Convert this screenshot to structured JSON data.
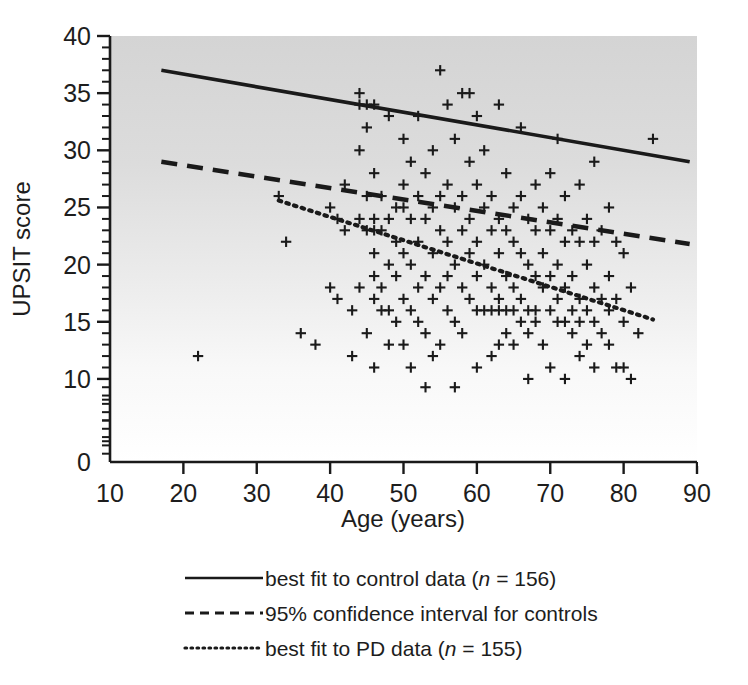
{
  "chart_data": {
    "type": "scatter",
    "title": "",
    "xlabel": "Age (years)",
    "ylabel": "UPSIT score",
    "xlim": [
      10,
      90
    ],
    "ylim": [
      0,
      40
    ],
    "xticks": [
      10,
      20,
      30,
      40,
      50,
      60,
      70,
      80,
      90
    ],
    "xtick_labels": [
      "10",
      "20",
      "30",
      "40",
      "50",
      "60",
      "70",
      "80",
      "90"
    ],
    "yticks": [
      0,
      10,
      15,
      20,
      25,
      30,
      35,
      40
    ],
    "ytick_labels": [
      "0",
      "10",
      "15",
      "20",
      "25",
      "30",
      "35",
      "40"
    ],
    "y_minor_step": 1,
    "x_minor_step": 10,
    "grid": false,
    "marker": "plus",
    "marker_color": "#1a1a1a",
    "plot_background": "vertical gradient light-grey (#d6d6d6) at top to white (#ffffff) at bottom",
    "background_top_color": "#d6d6d6",
    "background_bottom_color": "#ffffff",
    "legend_position": "below axes, centered",
    "series": [
      {
        "name": "best fit to control data",
        "type": "line",
        "style": "solid",
        "n": 156,
        "x": [
          17,
          89
        ],
        "y": [
          37.0,
          29.0
        ]
      },
      {
        "name": "95% confidence interval for controls",
        "type": "line",
        "style": "dashed",
        "x": [
          17,
          89
        ],
        "y": [
          29.0,
          21.8
        ]
      },
      {
        "name": "best fit to PD data",
        "type": "line",
        "style": "dotted",
        "n": 155,
        "x": [
          33,
          84
        ],
        "y": [
          25.6,
          15.2
        ]
      },
      {
        "name": "data points",
        "type": "scatter",
        "points": [
          [
            22,
            12
          ],
          [
            33,
            26
          ],
          [
            34,
            22
          ],
          [
            36,
            14
          ],
          [
            38,
            13
          ],
          [
            40,
            25
          ],
          [
            40,
            18
          ],
          [
            41,
            24
          ],
          [
            41,
            17
          ],
          [
            42,
            27
          ],
          [
            42,
            23
          ],
          [
            43,
            16
          ],
          [
            43,
            12
          ],
          [
            44,
            35
          ],
          [
            44,
            34
          ],
          [
            44,
            30
          ],
          [
            44,
            24
          ],
          [
            44,
            18
          ],
          [
            45,
            34
          ],
          [
            45,
            32
          ],
          [
            45,
            26
          ],
          [
            45,
            23
          ],
          [
            45,
            14
          ],
          [
            46,
            34
          ],
          [
            46,
            28
          ],
          [
            46,
            24
          ],
          [
            46,
            23
          ],
          [
            46,
            21
          ],
          [
            46,
            19
          ],
          [
            46,
            17
          ],
          [
            46,
            11
          ],
          [
            47,
            26
          ],
          [
            47,
            23
          ],
          [
            47,
            18
          ],
          [
            47,
            16
          ],
          [
            48,
            33
          ],
          [
            48,
            24
          ],
          [
            48,
            20
          ],
          [
            48,
            16
          ],
          [
            48,
            13
          ],
          [
            49,
            25
          ],
          [
            49,
            22
          ],
          [
            49,
            19
          ],
          [
            49,
            15
          ],
          [
            50,
            31
          ],
          [
            50,
            27
          ],
          [
            50,
            25
          ],
          [
            50,
            21
          ],
          [
            50,
            17
          ],
          [
            50,
            13
          ],
          [
            51,
            29
          ],
          [
            51,
            24
          ],
          [
            51,
            20
          ],
          [
            51,
            16
          ],
          [
            51,
            11
          ],
          [
            52,
            33
          ],
          [
            52,
            26
          ],
          [
            52,
            22
          ],
          [
            52,
            18
          ],
          [
            52,
            15
          ],
          [
            53,
            28
          ],
          [
            53,
            24
          ],
          [
            53,
            19
          ],
          [
            53,
            14
          ],
          [
            53,
            9
          ],
          [
            54,
            30
          ],
          [
            54,
            25
          ],
          [
            54,
            21
          ],
          [
            54,
            17
          ],
          [
            54,
            12
          ],
          [
            55,
            37
          ],
          [
            55,
            26
          ],
          [
            55,
            23
          ],
          [
            55,
            18
          ],
          [
            55,
            13
          ],
          [
            56,
            34
          ],
          [
            56,
            27
          ],
          [
            56,
            22
          ],
          [
            56,
            19
          ],
          [
            56,
            16
          ],
          [
            57,
            31
          ],
          [
            57,
            25
          ],
          [
            57,
            20
          ],
          [
            57,
            15
          ],
          [
            57,
            9
          ],
          [
            58,
            35
          ],
          [
            58,
            26
          ],
          [
            58,
            23
          ],
          [
            58,
            18
          ],
          [
            58,
            14
          ],
          [
            59,
            35
          ],
          [
            59,
            29
          ],
          [
            59,
            24
          ],
          [
            59,
            21
          ],
          [
            59,
            17
          ],
          [
            60,
            33
          ],
          [
            60,
            27
          ],
          [
            60,
            22
          ],
          [
            60,
            19
          ],
          [
            60,
            16
          ],
          [
            60,
            11
          ],
          [
            61,
            30
          ],
          [
            61,
            25
          ],
          [
            61,
            20
          ],
          [
            61,
            16
          ],
          [
            62,
            26
          ],
          [
            62,
            23
          ],
          [
            62,
            18
          ],
          [
            62,
            16
          ],
          [
            62,
            12
          ],
          [
            63,
            34
          ],
          [
            63,
            24
          ],
          [
            63,
            21
          ],
          [
            63,
            17
          ],
          [
            63,
            16
          ],
          [
            63,
            13
          ],
          [
            64,
            28
          ],
          [
            64,
            23
          ],
          [
            64,
            19
          ],
          [
            64,
            16
          ],
          [
            64,
            14
          ],
          [
            65,
            25
          ],
          [
            65,
            22
          ],
          [
            65,
            18
          ],
          [
            65,
            16
          ],
          [
            65,
            13
          ],
          [
            66,
            32
          ],
          [
            66,
            26
          ],
          [
            66,
            21
          ],
          [
            66,
            17
          ],
          [
            66,
            15
          ],
          [
            67,
            24
          ],
          [
            67,
            20
          ],
          [
            67,
            16
          ],
          [
            67,
            14
          ],
          [
            67,
            10
          ],
          [
            68,
            27
          ],
          [
            68,
            23
          ],
          [
            68,
            19
          ],
          [
            68,
            16
          ],
          [
            68,
            15
          ],
          [
            69,
            25
          ],
          [
            69,
            21
          ],
          [
            69,
            18
          ],
          [
            69,
            13
          ],
          [
            70,
            28
          ],
          [
            70,
            23
          ],
          [
            70,
            19
          ],
          [
            70,
            16
          ],
          [
            70,
            11
          ],
          [
            71,
            31
          ],
          [
            71,
            24
          ],
          [
            71,
            20
          ],
          [
            71,
            17
          ],
          [
            71,
            15
          ],
          [
            72,
            26
          ],
          [
            72,
            22
          ],
          [
            72,
            18
          ],
          [
            72,
            15
          ],
          [
            72,
            10
          ],
          [
            73,
            23
          ],
          [
            73,
            19
          ],
          [
            73,
            16
          ],
          [
            73,
            14
          ],
          [
            74,
            27
          ],
          [
            74,
            22
          ],
          [
            74,
            17
          ],
          [
            74,
            15
          ],
          [
            74,
            12
          ],
          [
            75,
            24
          ],
          [
            75,
            20
          ],
          [
            75,
            16
          ],
          [
            75,
            13
          ],
          [
            76,
            29
          ],
          [
            76,
            22
          ],
          [
            76,
            18
          ],
          [
            76,
            15
          ],
          [
            76,
            11
          ],
          [
            77,
            23
          ],
          [
            77,
            17
          ],
          [
            77,
            14
          ],
          [
            78,
            25
          ],
          [
            78,
            19
          ],
          [
            78,
            16
          ],
          [
            78,
            13
          ],
          [
            79,
            22
          ],
          [
            79,
            17
          ],
          [
            79,
            11
          ],
          [
            80,
            21
          ],
          [
            80,
            15
          ],
          [
            80,
            11
          ],
          [
            81,
            18
          ],
          [
            81,
            10
          ],
          [
            82,
            14
          ],
          [
            84,
            31
          ]
        ]
      }
    ]
  },
  "axes": {
    "x_title": "Age (years)",
    "y_title": "UPSIT score"
  },
  "legend": {
    "entries": [
      {
        "line_style": "solid",
        "text_before": "best fit to control data (",
        "italic": "n",
        "text_after": " = 156)",
        "full_label": "best fit to control data (n = 156)"
      },
      {
        "line_style": "dashed",
        "text_before": "95% confidence interval for controls",
        "italic": "",
        "text_after": "",
        "full_label": "95% confidence interval for controls"
      },
      {
        "line_style": "dotted",
        "text_before": "best fit to PD data (",
        "italic": "n",
        "text_after": " = 155)",
        "full_label": "best fit to PD data (n = 155)"
      }
    ]
  },
  "colors": {
    "ink": "#1a1a1a",
    "plot_top": "#d6d6d6",
    "plot_bottom": "#ffffff"
  }
}
